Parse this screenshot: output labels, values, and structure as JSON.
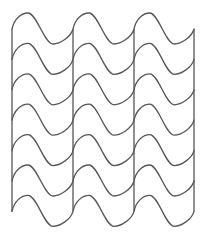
{
  "diagram": {
    "type": "wavy-line-pattern",
    "stroke_color": "#555555",
    "background_color": "#ffffff",
    "columns": 3,
    "rows": 7,
    "column_x": [
      12,
      73,
      134,
      194
    ],
    "row_start_y": 29,
    "row_spacing": 30.4,
    "wave": {
      "peak_dx": 16,
      "peak_dy": -16,
      "trough_dx": 41,
      "trough_dy": 15,
      "column_width": 61
    },
    "vertical_lines": {
      "top_y": 29,
      "bottom_y": 211.4
    }
  }
}
